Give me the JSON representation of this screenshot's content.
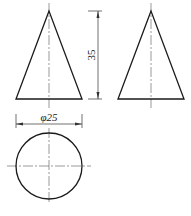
{
  "drawing": {
    "type": "three-view orthographic drawing of a cone",
    "views": [
      "front-view",
      "side-view",
      "top-view"
    ],
    "dimensions": {
      "height_label": "35",
      "diameter_label": "φ25"
    },
    "colors": {
      "line": "#1a1a1a",
      "center_line": "#555555",
      "background": "#ffffff"
    }
  }
}
